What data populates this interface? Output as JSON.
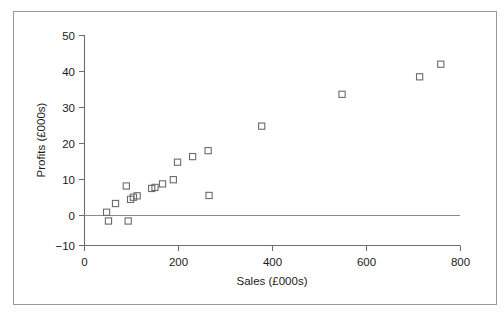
{
  "chart_data": {
    "type": "scatter",
    "title": "",
    "xlabel": "Sales (£000s)",
    "ylabel": "Profits (£000s)",
    "xlim": [
      0,
      800
    ],
    "ylim": [
      -10,
      50
    ],
    "xticks": [
      0,
      200,
      400,
      600,
      800
    ],
    "yticks": [
      -10,
      0,
      10,
      20,
      30,
      40,
      50
    ],
    "xtick_labels": [
      "0",
      "200",
      "400",
      "600",
      "800"
    ],
    "ytick_labels": [
      "−10",
      "0",
      "10",
      "20",
      "30",
      "40",
      "50"
    ],
    "grid": false,
    "legend": null,
    "marker": "open-square",
    "marker_color": "#6b6b6b",
    "reference_lines": [
      {
        "axis": "y",
        "value": 0,
        "color": "#8a8a8a"
      }
    ],
    "series": [
      {
        "name": "Sales vs Profits",
        "points": [
          {
            "x": 47,
            "y": -0.5
          },
          {
            "x": 51,
            "y": -3.0
          },
          {
            "x": 66,
            "y": 2.0
          },
          {
            "x": 89,
            "y": 7.0
          },
          {
            "x": 93,
            "y": -3.0
          },
          {
            "x": 98,
            "y": 3.2
          },
          {
            "x": 104,
            "y": 3.8
          },
          {
            "x": 112,
            "y": 4.2
          },
          {
            "x": 143,
            "y": 6.3
          },
          {
            "x": 150,
            "y": 6.6
          },
          {
            "x": 166,
            "y": 7.6
          },
          {
            "x": 189,
            "y": 8.8
          },
          {
            "x": 198,
            "y": 13.8
          },
          {
            "x": 230,
            "y": 15.4
          },
          {
            "x": 263,
            "y": 17.1
          },
          {
            "x": 265,
            "y": 4.3
          },
          {
            "x": 377,
            "y": 24.1
          },
          {
            "x": 548,
            "y": 33.2
          },
          {
            "x": 713,
            "y": 38.2
          },
          {
            "x": 758,
            "y": 41.8
          }
        ]
      }
    ]
  },
  "axes": {
    "x_title": "Sales (£000s)",
    "y_title": "Profits (£000s)"
  }
}
